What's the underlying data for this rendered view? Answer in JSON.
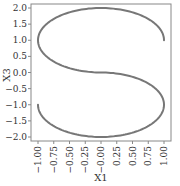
{
  "chart_data": {
    "type": "line",
    "title": "",
    "xlabel": "X1",
    "ylabel": "X3",
    "xlim": [
      -1.1,
      1.1
    ],
    "ylim": [
      -2.1,
      2.1
    ],
    "xticks": [
      -1.0,
      -0.75,
      -0.5,
      -0.25,
      0.0,
      0.25,
      0.5,
      0.75,
      1.0
    ],
    "xtick_labels": [
      "-1.00",
      "-0.75",
      "-0.50",
      "-0.25",
      "-0.00",
      "0.25",
      "0.50",
      "0.75",
      "1.00"
    ],
    "yticks": [
      2.0,
      1.5,
      1.0,
      0.5,
      0.0,
      -0.5,
      -1.0,
      -1.5,
      -2.0
    ],
    "ytick_labels": [
      "2.0",
      "1.5",
      "1.0",
      "0.5",
      "0.0",
      "-0.5",
      "-1.0",
      "-1.5",
      "-2.0"
    ],
    "grid": false,
    "legend": null,
    "series": [
      {
        "name": "S-curve (X1 vs X3)",
        "color": "#777777",
        "description": "Upper arc: from (1,1) over (0,2) around (-1,1) to (0,0); lower arc: from (0,0) around (1,-1) through (0,-2) to (-1,-1)",
        "x": [
          1.0,
          0.71,
          0.0,
          -0.71,
          -1.0,
          -0.71,
          0.0,
          0.71,
          1.0,
          0.71,
          0.0,
          -0.71,
          -1.0
        ],
        "y": [
          1.0,
          1.71,
          2.0,
          1.71,
          1.0,
          0.29,
          0.0,
          -0.29,
          -1.0,
          -1.71,
          -2.0,
          -1.71,
          -1.0
        ]
      }
    ]
  }
}
